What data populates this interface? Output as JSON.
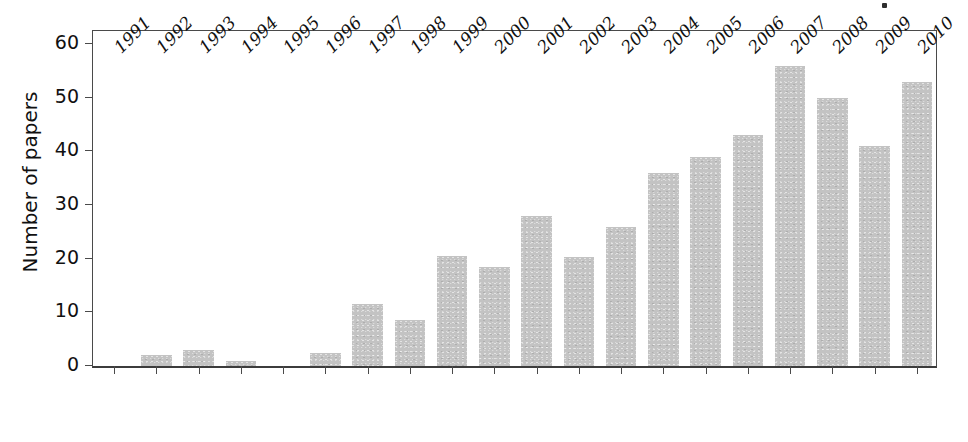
{
  "chart_data": {
    "type": "bar",
    "title": "",
    "subtitle": "",
    "xlabel": "",
    "ylabel": "Number of papers",
    "categories": [
      "1991",
      "1992",
      "1993",
      "1994",
      "1995",
      "1996",
      "1997",
      "1998",
      "1999",
      "2000",
      "2001",
      "2002",
      "2003",
      "2004",
      "2005",
      "2006",
      "2007",
      "2008",
      "2009",
      "2010"
    ],
    "values": [
      0,
      2,
      3,
      1,
      0,
      2.5,
      11.5,
      8.5,
      20.5,
      18.5,
      28,
      20.3,
      26,
      36,
      39,
      43,
      56,
      50,
      41,
      53
    ],
    "ylim": [
      0,
      63
    ],
    "yticks": [
      0,
      10,
      20,
      30,
      40,
      50,
      60
    ],
    "ytick_labels": [
      "0",
      "10",
      "20",
      "30",
      "40",
      "50",
      "60"
    ],
    "grid": false,
    "legend": false,
    "legend_position": "none",
    "bar_color": "#c3c3c3",
    "axis_color": "#4a4a4a",
    "text_color": "#111111",
    "xtick_rotation": -45
  }
}
